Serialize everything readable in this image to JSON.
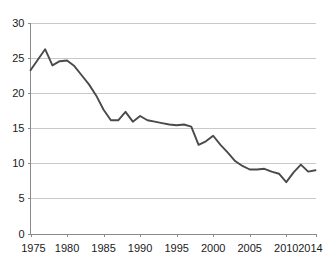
{
  "chart_data": {
    "type": "line",
    "title": "",
    "subtitle": "",
    "xlabel": "",
    "ylabel": "",
    "xlim": [
      1975,
      2014
    ],
    "ylim": [
      0,
      30
    ],
    "grid": "horizontal",
    "legend": "none",
    "y_ticks": [
      0,
      5,
      10,
      15,
      20,
      25,
      30
    ],
    "y_tick_labels": [
      "0",
      "5",
      "10",
      "15",
      "20",
      "25",
      "30"
    ],
    "x_ticks": [
      1975,
      1980,
      1985,
      1990,
      1995,
      2000,
      2005,
      2010,
      2014
    ],
    "x_tick_labels": [
      "1975",
      "1980",
      "1985",
      "1990",
      "1995",
      "2000",
      "2005",
      "2010",
      "2014"
    ],
    "series": [
      {
        "name": "rate",
        "color": "#4a4a4a",
        "x": [
          1975,
          1976,
          1977,
          1978,
          1979,
          1980,
          1981,
          1982,
          1983,
          1984,
          1985,
          1986,
          1987,
          1988,
          1989,
          1990,
          1991,
          1992,
          1993,
          1994,
          1995,
          1996,
          1997,
          1998,
          1999,
          2000,
          2001,
          2002,
          2003,
          2004,
          2005,
          2006,
          2007,
          2008,
          2009,
          2010,
          2011,
          2012,
          2013,
          2014
        ],
        "values": [
          23.2,
          24.7,
          26.2,
          23.9,
          24.5,
          24.6,
          23.8,
          22.5,
          21.2,
          19.6,
          17.6,
          16.1,
          16.1,
          17.3,
          15.9,
          16.7,
          16.1,
          15.9,
          15.7,
          15.5,
          15.4,
          15.5,
          15.2,
          12.6,
          13.1,
          13.9,
          12.6,
          11.5,
          10.3,
          9.6,
          9.1,
          9.1,
          9.2,
          8.8,
          8.5,
          7.3,
          8.7,
          9.8,
          8.8,
          9.0
        ]
      }
    ]
  },
  "axes": {
    "y_axis_name": "value-axis",
    "x_axis_name": "year-axis"
  }
}
